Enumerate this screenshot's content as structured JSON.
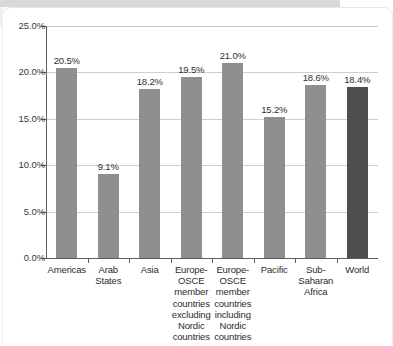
{
  "chart_data": {
    "type": "bar",
    "title": "",
    "subtitle": "",
    "xlabel": "",
    "ylabel": "",
    "ylim": [
      0,
      25
    ],
    "ytick_format": "percent",
    "grid": true,
    "legend": null,
    "categories": [
      "Americas",
      "Arab\nStates",
      "Asia",
      "Europe-\nOSCE\nmember\ncountries\nexcluding\nNordic\ncountries",
      "Europe-\nOSCE\nmember\ncountries\nincluding\nNordic\ncountries",
      "Pacific",
      "Sub-\nSaharan\nAfrica",
      "World"
    ],
    "values": [
      20.5,
      9.1,
      18.2,
      19.5,
      21.0,
      15.2,
      18.6,
      18.4
    ],
    "data_labels": [
      "20.5%",
      "9.1%",
      "18.2%",
      "19.5%",
      "21.0%",
      "15.2%",
      "18.6%",
      "18.4%"
    ],
    "highlight_index": 7,
    "yticks": [
      0,
      5,
      10,
      15,
      20,
      25
    ],
    "ytick_labels": [
      "0.0%",
      "5.0%",
      "10.0%",
      "15.0%",
      "20.0%",
      "25.0%"
    ],
    "colors": {
      "bar": "#8f8f90",
      "bar_highlight": "#4e4e4f",
      "gridline": "#cfcfd0",
      "axis": "#5f5f60",
      "text": "#2b2b2c",
      "page": "#ffffff"
    }
  }
}
